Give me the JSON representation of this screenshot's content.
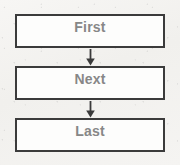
{
  "diagram": {
    "background_color": "#f4f3f1",
    "border_color": "#3b3b3b",
    "box_fill_color": "#fdfdfc",
    "label_color": "#878787",
    "arrow_color": "#3b3b3b",
    "nodes": [
      {
        "id": "first",
        "label": "First"
      },
      {
        "id": "next",
        "label": "Next"
      },
      {
        "id": "last",
        "label": "Last"
      }
    ],
    "connectors": [
      {
        "id": "first-next",
        "from": "first",
        "to": "next",
        "icon": "arrow-down-icon"
      },
      {
        "id": "next-last",
        "from": "next",
        "to": "last",
        "icon": "arrow-down-icon"
      }
    ]
  }
}
